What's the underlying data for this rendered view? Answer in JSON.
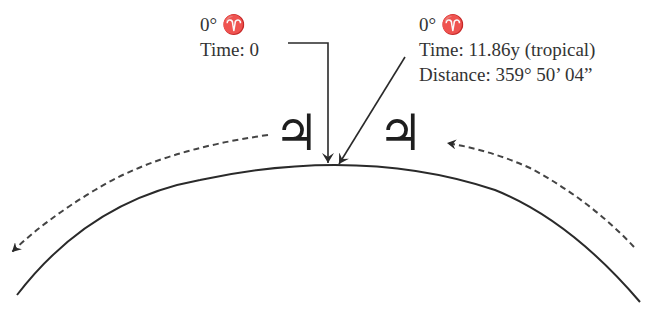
{
  "diagram": {
    "type": "orbital-position-illustration",
    "colors": {
      "stroke": "#2a2a2a",
      "text": "#333333",
      "background": "#ffffff"
    },
    "left_label": {
      "position": "0° ♈",
      "time": "Time: 0"
    },
    "right_label": {
      "position": "0° ♈",
      "time": "Time: 11.86y (tropical)",
      "distance": "Distance: 359° 50’ 04”"
    },
    "planets": [
      {
        "name": "jupiter-start",
        "glyph": "♃"
      },
      {
        "name": "jupiter-end",
        "glyph": "♃"
      }
    ],
    "arrows": {
      "left_pointer": "solid elbow arrow from label to orbit",
      "right_pointer": "solid diagonal arrow from label to orbit",
      "left_motion": "dashed arrow along orbit toward lower-left",
      "right_motion": "dashed arrow along orbit toward Jupiter (right-to-left)"
    }
  }
}
